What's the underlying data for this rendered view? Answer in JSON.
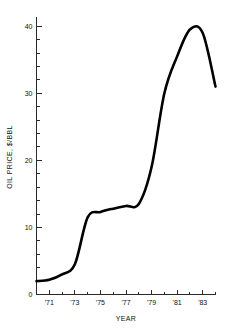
{
  "chart_data": {
    "type": "line",
    "title": "",
    "xlabel": "YEAR",
    "ylabel": "OIL PRICE, $/BBL",
    "x": [
      1970,
      1971,
      1972,
      1973,
      1974,
      1975,
      1976,
      1977,
      1978,
      1979,
      1980,
      1981,
      1982,
      1983,
      1984
    ],
    "values": [
      2.0,
      2.2,
      3.0,
      4.5,
      11.5,
      12.3,
      12.8,
      13.2,
      13.5,
      19.0,
      30.0,
      35.5,
      39.5,
      39.0,
      31.0
    ],
    "series": [
      {
        "name": "Oil Price",
        "values": [
          2.0,
          2.2,
          3.0,
          4.5,
          11.5,
          12.3,
          12.8,
          13.2,
          13.5,
          19.0,
          30.0,
          35.5,
          39.5,
          39.0,
          31.0
        ],
        "color": "#000000"
      }
    ],
    "xlim": [
      1970,
      1984
    ],
    "ylim": [
      0,
      41
    ],
    "x_tick_labels": [
      "'71",
      "'73",
      "'75",
      "'77",
      "'79",
      "'81",
      "'83"
    ],
    "x_tick_values": [
      1971,
      1973,
      1975,
      1977,
      1979,
      1981,
      1983
    ],
    "x_minor_tick_values": [
      1970,
      1972,
      1974,
      1976,
      1978,
      1980,
      1982,
      1984
    ],
    "y_tick_labels": [
      "0",
      "10",
      "20",
      "30",
      "40"
    ],
    "y_tick_values": [
      0,
      10,
      20,
      30,
      40
    ],
    "y_minor_tick_values": [
      2,
      4,
      6,
      8,
      12,
      14,
      16,
      18,
      22,
      24,
      26,
      28,
      32,
      34,
      36,
      38
    ],
    "grid": false,
    "legend": false,
    "legend_position": "none",
    "line_color": "#000000",
    "axis_color": "#2a2a2a",
    "background_color": "#ffffff"
  }
}
